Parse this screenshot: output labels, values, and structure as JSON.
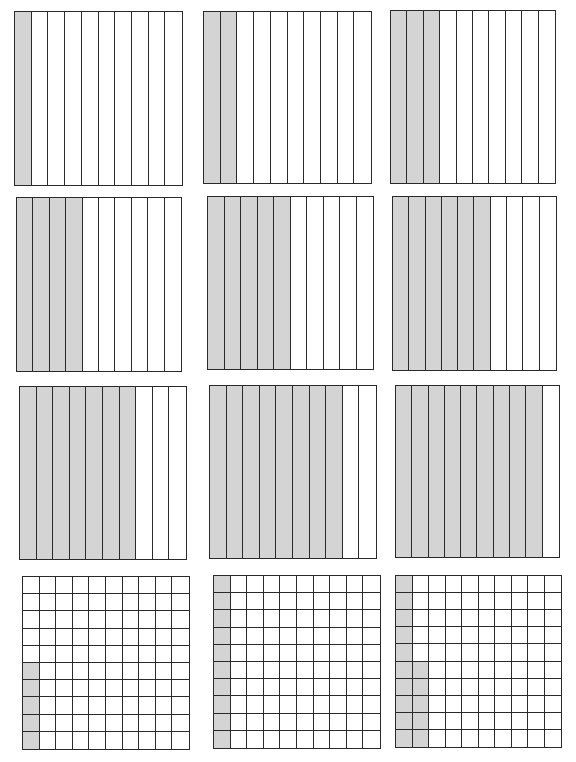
{
  "worksheet": {
    "title": "",
    "colors": {
      "shaded": "#d4d4d4",
      "unshaded": "#ffffff",
      "line": "#2a2a2a"
    }
  },
  "models": [
    {
      "id": "tenths-1",
      "type": "tenths",
      "rows": 1,
      "cols": 10,
      "shaded_count": 1,
      "fraction": "1/10",
      "decimal": "0.1",
      "box": {
        "x": 14,
        "y": 11,
        "w": 169,
        "h": 175
      }
    },
    {
      "id": "tenths-2",
      "type": "tenths",
      "rows": 1,
      "cols": 10,
      "shaded_count": 2,
      "fraction": "2/10",
      "decimal": "0.2",
      "box": {
        "x": 203,
        "y": 11,
        "w": 169,
        "h": 173
      }
    },
    {
      "id": "tenths-3",
      "type": "tenths",
      "rows": 1,
      "cols": 10,
      "shaded_count": 3,
      "fraction": "3/10",
      "decimal": "0.3",
      "box": {
        "x": 390,
        "y": 10,
        "w": 166,
        "h": 174
      }
    },
    {
      "id": "tenths-4",
      "type": "tenths",
      "rows": 1,
      "cols": 10,
      "shaded_count": 4,
      "fraction": "4/10",
      "decimal": "0.4",
      "box": {
        "x": 16,
        "y": 197,
        "w": 166,
        "h": 175
      }
    },
    {
      "id": "tenths-5",
      "type": "tenths",
      "rows": 1,
      "cols": 10,
      "shaded_count": 5,
      "fraction": "5/10",
      "decimal": "0.5",
      "box": {
        "x": 207,
        "y": 196,
        "w": 167,
        "h": 174
      }
    },
    {
      "id": "tenths-6",
      "type": "tenths",
      "rows": 1,
      "cols": 10,
      "shaded_count": 6,
      "fraction": "6/10",
      "decimal": "0.6",
      "box": {
        "x": 392,
        "y": 196,
        "w": 165,
        "h": 175
      }
    },
    {
      "id": "tenths-7",
      "type": "tenths",
      "rows": 1,
      "cols": 10,
      "shaded_count": 7,
      "fraction": "7/10",
      "decimal": "0.7",
      "box": {
        "x": 19,
        "y": 386,
        "w": 168,
        "h": 174
      }
    },
    {
      "id": "tenths-8",
      "type": "tenths",
      "rows": 1,
      "cols": 10,
      "shaded_count": 8,
      "fraction": "8/10",
      "decimal": "0.8",
      "box": {
        "x": 209,
        "y": 385,
        "w": 168,
        "h": 174
      }
    },
    {
      "id": "tenths-9",
      "type": "tenths",
      "rows": 1,
      "cols": 10,
      "shaded_count": 9,
      "fraction": "9/10",
      "decimal": "0.9",
      "box": {
        "x": 395,
        "y": 385,
        "w": 165,
        "h": 173
      }
    },
    {
      "id": "hundredths-1",
      "type": "hundredths",
      "rows": 10,
      "cols": 10,
      "shaded_count": 5,
      "fraction": "5/100",
      "decimal": "0.05",
      "shaded_pattern": "column 1, bottom 5 rows",
      "box": {
        "x": 22,
        "y": 576,
        "w": 168,
        "h": 174
      }
    },
    {
      "id": "hundredths-2",
      "type": "hundredths",
      "rows": 10,
      "cols": 10,
      "shaded_count": 10,
      "fraction": "10/100",
      "decimal": "0.10",
      "shaded_pattern": "column 1, all rows",
      "box": {
        "x": 213,
        "y": 575,
        "w": 168,
        "h": 174
      }
    },
    {
      "id": "hundredths-3",
      "type": "hundredths",
      "rows": 10,
      "cols": 10,
      "shaded_count": 15,
      "fraction": "15/100",
      "decimal": "0.15",
      "shaded_pattern": "column 1 all rows + column 2 bottom 5 rows",
      "box": {
        "x": 395,
        "y": 575,
        "w": 167,
        "h": 173
      }
    }
  ]
}
